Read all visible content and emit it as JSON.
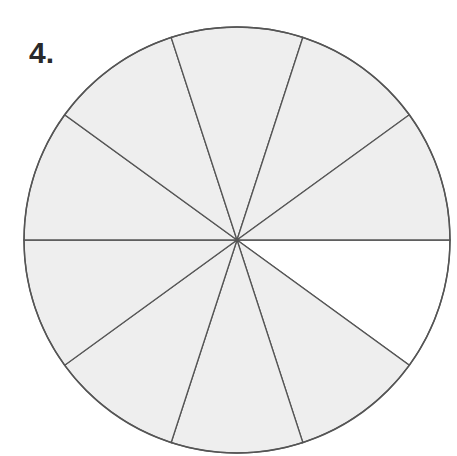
{
  "problem": {
    "number_label": "4.",
    "diagram": {
      "type": "fraction-circle",
      "total_sectors": 10,
      "shaded_sectors": 9,
      "unshaded_sectors": 1,
      "shaded_color": "#eeeeee",
      "unshaded_color": "#ffffff",
      "line_color": "#555555",
      "center": [
        237,
        240
      ],
      "radius": 213,
      "unshaded_index": 0
    }
  }
}
